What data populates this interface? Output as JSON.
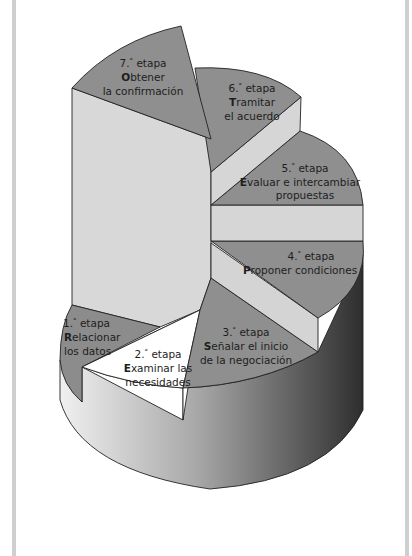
{
  "diagram": {
    "colors": {
      "slice_top": "#8f8f8f",
      "slab_light": "#d6d6d6",
      "highlight_slice": "#ffffff",
      "side_dark": "#3a3a3a",
      "side_light": "#e4e4e4",
      "frame": "#cfcfcf"
    },
    "stages": [
      {
        "number": "1.",
        "ordinal": "°",
        "word": "etapa",
        "initial": "R",
        "rest_line1": "elacionar",
        "line2": "los datos"
      },
      {
        "number": "2.",
        "ordinal": "°",
        "word": "etapa",
        "initial": "E",
        "rest_line1": "xaminar las",
        "line2": "necesidades"
      },
      {
        "number": "3.",
        "ordinal": "°",
        "word": "etapa",
        "initial": "S",
        "rest_line1": "eñalar el inicio",
        "line2": "de la negociación"
      },
      {
        "number": "4.",
        "ordinal": "°",
        "word": "etapa",
        "initial": "P",
        "rest_line1": "roponer condiciones",
        "line2": ""
      },
      {
        "number": "5.",
        "ordinal": "°",
        "word": "etapa",
        "initial": "E",
        "rest_line1": "valuar e intercambiar",
        "line2": "propuestas"
      },
      {
        "number": "6.",
        "ordinal": "°",
        "word": "etapa",
        "initial": "T",
        "rest_line1": "ramitar",
        "line2": "el acuerdo"
      },
      {
        "number": "7.",
        "ordinal": "°",
        "word": "etapa",
        "initial": "O",
        "rest_line1": "btener",
        "line2": "la confirmación"
      }
    ]
  }
}
